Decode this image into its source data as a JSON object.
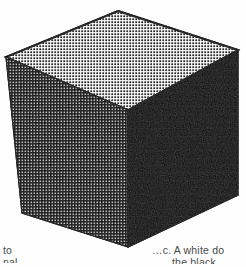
{
  "figure": {
    "name": "halftone-cube",
    "background_color": "#fefefe",
    "ink_color": "#000000",
    "paper_color": "#ffffff",
    "faces": [
      {
        "id": "top",
        "label": "top-face",
        "screen": "black-dots-on-white",
        "tone": "light",
        "dot_pitch_px": 3,
        "dot_color": "#000000",
        "ground_color": "#ffffff"
      },
      {
        "id": "left",
        "label": "left-face",
        "screen": "white-dots-on-black",
        "tone": "dark",
        "dot_pitch_px": 3,
        "dot_color": "#ffffff",
        "ground_color": "#000000"
      },
      {
        "id": "right",
        "label": "right-face",
        "screen": "solid",
        "tone": "solid-black",
        "dot_pitch_px": 0,
        "dot_color": "#000000",
        "ground_color": "#000000"
      }
    ],
    "vertices": {
      "top": [
        118,
        11
      ],
      "left": [
        6,
        57
      ],
      "right": [
        238,
        50
      ],
      "center": [
        128,
        110
      ],
      "bottom_left": [
        22,
        213
      ],
      "bottom": [
        128,
        247
      ],
      "bottom_right": [
        238,
        195
      ]
    },
    "outline_width_px": 1.6
  },
  "captions": {
    "left": {
      "name": "caption-fragment-left",
      "line_1": "to",
      "line_2": "nal"
    },
    "right": {
      "name": "caption-fragment-right",
      "line_1": "…c. A white do",
      "line_2": "the black"
    }
  }
}
